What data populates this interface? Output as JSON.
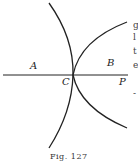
{
  "figure": {
    "caption": "Fig. 127",
    "labels": {
      "A": "A",
      "B": "B",
      "C": "C",
      "P": "P"
    },
    "elements": [
      "horizontal axis line through C to P",
      "left-opening curve through C",
      "right-opening parabola-like curve with vertex at C"
    ]
  },
  "page_fragments": [
    "g",
    "l",
    "t",
    "e",
    "-"
  ]
}
